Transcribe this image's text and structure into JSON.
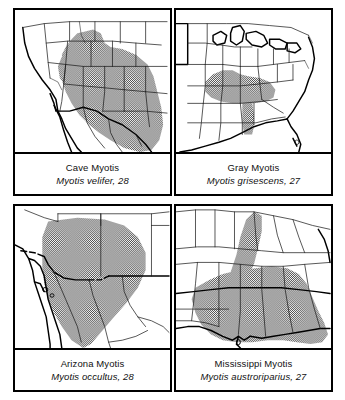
{
  "figure": {
    "kind": "distribution-map-plate",
    "panel_count": 4,
    "shading_legend": "stippled gray = species range",
    "colors": {
      "ink": "#000000",
      "range_fill_gray": "#9a9a9a",
      "page_background": "#ffffff"
    }
  },
  "panels": [
    {
      "id": "cave-myotis",
      "position": "top-left",
      "common_name": "Cave Myotis",
      "scientific_line": "Myotis velifer, 28",
      "scientific_name": "Myotis velifer",
      "map_number": "28",
      "region": "Southwestern United States and Mexico"
    },
    {
      "id": "gray-myotis",
      "position": "top-right",
      "common_name": "Gray Myotis",
      "scientific_line": "Myotis grisescens, 27",
      "scientific_name": "Myotis grisescens",
      "map_number": "27",
      "region": "Eastern United States"
    },
    {
      "id": "arizona-myotis",
      "position": "bottom-left",
      "common_name": "Arizona Myotis",
      "scientific_line": "Myotis occultus, 28",
      "scientific_name": "Myotis occultus",
      "map_number": "28",
      "region": "Arizona, New Mexico and northern Mexico"
    },
    {
      "id": "mississippi-myotis",
      "position": "bottom-right",
      "common_name": "Mississippi Myotis",
      "scientific_line": "Myotis austroriparius, 27",
      "scientific_name": "Myotis austroriparius",
      "map_number": "27",
      "region": "Southeastern United States and Gulf Coast"
    }
  ]
}
